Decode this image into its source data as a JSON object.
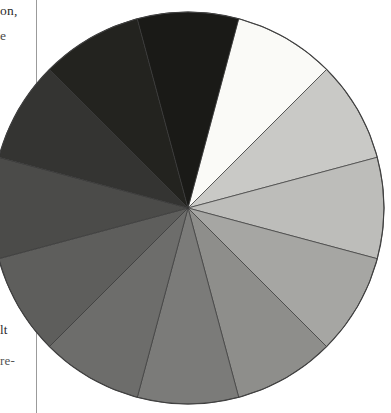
{
  "page": {
    "width": 391,
    "height": 413,
    "background": "#ffffff",
    "rule_color": "#9b9b9b"
  },
  "margin_text": {
    "fragment_top_1": "on,",
    "fragment_top_2": "e",
    "fragment_bottom_1": "lt",
    "fragment_bottom_2": "re-"
  },
  "figure": {
    "name": "grayscale-value-wheel",
    "center_x": 188,
    "center_y": 208,
    "radius": 196,
    "outline_color": "#3f3f3f",
    "divider_color": "#3a3a3a",
    "sector_count": 12
  },
  "chart_data": {
    "type": "pie",
    "xlabel": "",
    "ylabel": "",
    "legend_position": "none",
    "grid": false,
    "categories": [
      "Value 1 — White",
      "Value 2 — Light Gray 1",
      "Value 3 — Light Gray 2",
      "Value 4 — Light Middle Gray",
      "Value 5 — Middle Gray",
      "Value 6 — Dark Middle Gray",
      "Value 7 — Dark Gray 1",
      "Value 8 — Dark Gray 2",
      "Value 9 — Very Dark Gray",
      "Value 10 — Near Black 1",
      "Value 11 — Near Black 2",
      "Value 12 — Black"
    ],
    "values": [
      8.333,
      8.333,
      8.333,
      8.333,
      8.333,
      8.333,
      8.333,
      8.333,
      8.333,
      8.333,
      8.333,
      8.333
    ],
    "colors": [
      "#fafaf7",
      "#c9c9c6",
      "#bdbdba",
      "#a6a6a3",
      "#8e8e8b",
      "#7b7b79",
      "#6d6d6b",
      "#5e5e5c",
      "#4b4b49",
      "#343432",
      "#23231f",
      "#1a1a17"
    ],
    "start_angle_deg": -75,
    "sweep_per_sector_deg": 30,
    "direction": "clockwise",
    "annotations": []
  }
}
